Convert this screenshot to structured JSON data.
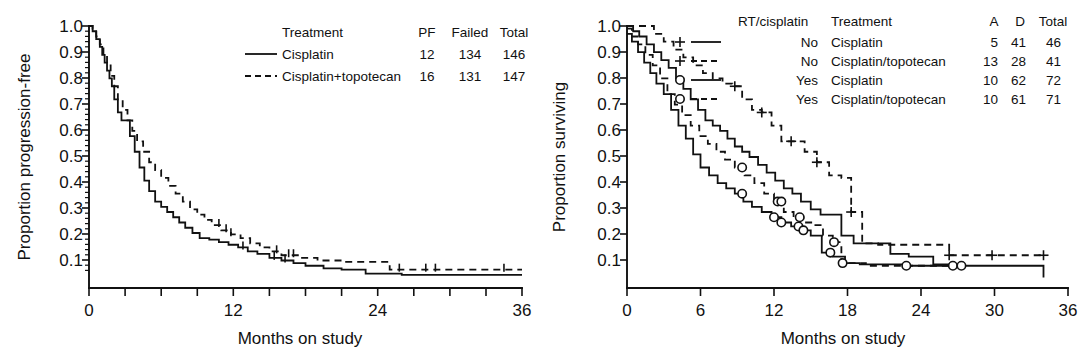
{
  "figure": {
    "panels": [
      "progression-free-survival",
      "overall-survival"
    ]
  },
  "left_panel": {
    "ylabel": "Proportion progression-free",
    "xlabel": "Months on study",
    "y_ticks": [
      "1.0",
      "0.9",
      "0.8",
      "0.7",
      "0.6",
      "0.5",
      "0.4",
      "0.3",
      "0.2",
      "0.1"
    ],
    "x_ticks": [
      "0",
      "12",
      "24",
      "36"
    ],
    "legend": {
      "headers": [
        "Treatment",
        "PF",
        "Failed",
        "Total"
      ],
      "rows": [
        {
          "style": "solid",
          "treatment": "Cisplatin",
          "pf": "12",
          "failed": "134",
          "total": "146"
        },
        {
          "style": "dashed",
          "treatment": "Cisplatin+topotecan",
          "pf": "16",
          "failed": "131",
          "total": "147"
        }
      ]
    }
  },
  "right_panel": {
    "ylabel": "Proportion surviving",
    "xlabel": "Months on study",
    "y_ticks": [
      "1.0",
      "0.9",
      "0.8",
      "0.7",
      "0.6",
      "0.5",
      "0.4",
      "0.3",
      "0.2",
      "0.1"
    ],
    "x_ticks": [
      "0",
      "6",
      "12",
      "18",
      "24",
      "30",
      "36"
    ],
    "legend": {
      "headers": [
        "RT/cisplatin",
        "Treatment",
        "A",
        "D",
        "Total"
      ],
      "rows": [
        {
          "marker": "plus",
          "style": "solid",
          "rt": "No",
          "treatment": "Cisplatin",
          "a": "5",
          "d": "41",
          "total": "46"
        },
        {
          "marker": "plus",
          "style": "dashed",
          "rt": "No",
          "treatment": "Cisplatin/topotecan",
          "a": "13",
          "d": "28",
          "total": "41"
        },
        {
          "marker": "circle",
          "style": "solid",
          "rt": "Yes",
          "treatment": "Cisplatin",
          "a": "10",
          "d": "62",
          "total": "72"
        },
        {
          "marker": "circle",
          "style": "dashed",
          "rt": "Yes",
          "treatment": "Cisplatin/topotecan",
          "a": "10",
          "d": "61",
          "total": "71"
        }
      ]
    }
  },
  "chart_data": [
    {
      "type": "line",
      "name": "progression-free-survival",
      "title": "",
      "xlabel": "Months on study",
      "ylabel": "Proportion progression-free",
      "xlim": [
        0,
        36
      ],
      "ylim": [
        0,
        1.0
      ],
      "grid": false,
      "legend_position": "top-right",
      "series": [
        {
          "name": "Cisplatin",
          "style": "solid",
          "pf": 12,
          "failed": 134,
          "total": 146,
          "x": [
            0,
            0.3,
            0.6,
            0.9,
            1.1,
            1.3,
            1.5,
            1.7,
            1.9,
            2.1,
            2.4,
            2.7,
            3.0,
            3.4,
            3.8,
            4.2,
            4.6,
            5.0,
            5.5,
            6.0,
            6.5,
            7.0,
            7.5,
            8.0,
            8.6,
            9.2,
            10.0,
            10.8,
            11.6,
            12.4,
            13.2,
            14.0,
            15.0,
            16.0,
            17.0,
            18.0,
            19.5,
            21.0,
            23.0,
            26.0,
            30.0,
            36.0
          ],
          "y": [
            1.0,
            0.98,
            0.95,
            0.92,
            0.89,
            0.86,
            0.83,
            0.8,
            0.77,
            0.72,
            0.67,
            0.64,
            0.64,
            0.58,
            0.52,
            0.46,
            0.41,
            0.37,
            0.33,
            0.31,
            0.29,
            0.27,
            0.25,
            0.23,
            0.21,
            0.19,
            0.185,
            0.175,
            0.165,
            0.155,
            0.14,
            0.13,
            0.115,
            0.105,
            0.095,
            0.085,
            0.075,
            0.07,
            0.055,
            0.05,
            0.05,
            0.05
          ]
        },
        {
          "name": "Cisplatin+topotecan",
          "style": "dashed",
          "pf": 16,
          "failed": 131,
          "total": 147,
          "x": [
            0,
            0.3,
            0.6,
            0.9,
            1.2,
            1.5,
            1.8,
            2.1,
            2.4,
            2.8,
            3.2,
            3.6,
            4.0,
            4.5,
            5.0,
            5.5,
            6.0,
            6.6,
            7.2,
            7.8,
            8.4,
            9.0,
            9.6,
            10.2,
            11.0,
            11.8,
            12.6,
            13.4,
            14.2,
            15.0,
            16.0,
            17.5,
            19.0,
            21.0,
            23.0,
            25.0,
            28.0,
            32.0,
            36.0
          ],
          "y": [
            1.0,
            0.99,
            0.96,
            0.93,
            0.89,
            0.85,
            0.81,
            0.77,
            0.72,
            0.68,
            0.64,
            0.6,
            0.56,
            0.52,
            0.48,
            0.45,
            0.42,
            0.39,
            0.36,
            0.33,
            0.3,
            0.28,
            0.26,
            0.24,
            0.22,
            0.205,
            0.19,
            0.17,
            0.155,
            0.14,
            0.125,
            0.115,
            0.105,
            0.1,
            0.1,
            0.07,
            0.07,
            0.07,
            0.07
          ]
        }
      ],
      "censor_marks": {
        "Cisplatin": [
          12.8,
          15.4,
          16.3
        ],
        "Cisplatin+topotecan": [
          10.8,
          11.4,
          11.8,
          15.6,
          16.6,
          17.0,
          25.8,
          28.0,
          28.8,
          34.5
        ]
      }
    },
    {
      "type": "line",
      "name": "overall-survival",
      "title": "",
      "xlabel": "Months on study",
      "ylabel": "Proportion surviving",
      "xlim": [
        0,
        36
      ],
      "ylim": [
        0,
        1.0
      ],
      "grid": false,
      "legend_position": "top-right",
      "series": [
        {
          "name": "No RT / Cisplatin",
          "marker": "plus",
          "style": "solid",
          "a": 5,
          "d": 41,
          "total": 46,
          "x": [
            0,
            0.5,
            1.0,
            1.6,
            2.2,
            2.8,
            3.4,
            4.0,
            4.6,
            5.2,
            5.8,
            6.4,
            7.0,
            7.6,
            8.2,
            8.8,
            9.4,
            10.0,
            10.7,
            11.4,
            12.1,
            12.8,
            13.5,
            14.2,
            15.0,
            15.8,
            16.6,
            17.5,
            18.5,
            20.0,
            21.5,
            23.0,
            25.0,
            26.5
          ],
          "y": [
            1.0,
            0.98,
            0.96,
            0.93,
            0.9,
            0.87,
            0.84,
            0.8,
            0.76,
            0.72,
            0.68,
            0.64,
            0.62,
            0.6,
            0.57,
            0.54,
            0.52,
            0.5,
            0.47,
            0.44,
            0.41,
            0.38,
            0.36,
            0.33,
            0.3,
            0.28,
            0.28,
            0.2,
            0.17,
            0.17,
            0.13,
            0.12,
            0.09,
            0.09
          ]
        },
        {
          "name": "No RT / Cisplatin+topotecan",
          "marker": "plus",
          "style": "dashed",
          "a": 13,
          "d": 28,
          "total": 41,
          "x": [
            0,
            0.6,
            1.4,
            2.2,
            3.0,
            3.8,
            4.6,
            5.4,
            6.2,
            7.0,
            7.8,
            8.6,
            9.4,
            10.2,
            11.0,
            11.8,
            12.6,
            13.4,
            14.5,
            15.5,
            16.5,
            17.5,
            18.3,
            19.2,
            20.5,
            24.0,
            26.3,
            29.8,
            34.0
          ],
          "y": [
            1.0,
            1.0,
            1.0,
            0.97,
            0.94,
            0.91,
            0.88,
            0.85,
            0.82,
            0.8,
            0.78,
            0.77,
            0.72,
            0.68,
            0.67,
            0.62,
            0.56,
            0.56,
            0.52,
            0.48,
            0.43,
            0.42,
            0.29,
            0.17,
            0.165,
            0.165,
            0.125,
            0.125,
            0.125
          ]
        },
        {
          "name": "Yes RT / Cisplatin",
          "marker": "circle",
          "style": "solid",
          "a": 10,
          "d": 62,
          "total": 72,
          "x": [
            0,
            0.4,
            0.9,
            1.4,
            1.9,
            2.4,
            3.0,
            3.6,
            4.2,
            4.8,
            5.4,
            6.0,
            6.7,
            7.4,
            8.1,
            8.8,
            9.5,
            10.2,
            11.0,
            11.8,
            12.6,
            13.4,
            14.2,
            15.0,
            15.9,
            16.8,
            17.8,
            19.0,
            20.5,
            22.5,
            25.0,
            34.0
          ],
          "y": [
            0.97,
            0.94,
            0.9,
            0.86,
            0.82,
            0.78,
            0.74,
            0.68,
            0.62,
            0.57,
            0.51,
            0.46,
            0.43,
            0.4,
            0.38,
            0.36,
            0.33,
            0.31,
            0.29,
            0.27,
            0.25,
            0.235,
            0.22,
            0.2,
            0.135,
            0.12,
            0.095,
            0.09,
            0.09,
            0.085,
            0.085,
            0.04
          ]
        },
        {
          "name": "Yes RT / Cisplatin+topotecan",
          "marker": "circle",
          "style": "dashed",
          "a": 10,
          "d": 61,
          "total": 71,
          "x": [
            0,
            0.4,
            0.9,
            1.5,
            2.1,
            2.7,
            3.3,
            3.9,
            4.5,
            5.2,
            5.9,
            6.6,
            7.3,
            8.0,
            8.8,
            9.6,
            10.4,
            11.2,
            12.0,
            12.8,
            13.6,
            14.4,
            15.2,
            16.0,
            16.8,
            17.5,
            19.5,
            22.0,
            25.0,
            27.3
          ],
          "y": [
            0.99,
            0.96,
            0.93,
            0.89,
            0.85,
            0.8,
            0.74,
            0.7,
            0.66,
            0.62,
            0.58,
            0.55,
            0.52,
            0.49,
            0.46,
            0.43,
            0.4,
            0.36,
            0.33,
            0.29,
            0.27,
            0.25,
            0.24,
            0.2,
            0.175,
            0.095,
            0.085,
            0.085,
            0.085,
            0.085
          ]
        }
      ],
      "censor_marks": {
        "No RT / Cisplatin+topotecan": [
          8.8,
          11.0,
          13.4,
          15.5,
          18.3,
          26.3,
          29.8,
          34.0
        ],
        "Yes RT / Cisplatin": [
          9.4,
          12.0,
          12.6,
          14.0,
          14.4,
          16.6,
          22.8,
          26.6
        ],
        "Yes RT / Cisplatin+topotecan": [
          9.4,
          12.3,
          12.6,
          14.1,
          16.9,
          17.6,
          27.3
        ]
      }
    }
  ]
}
